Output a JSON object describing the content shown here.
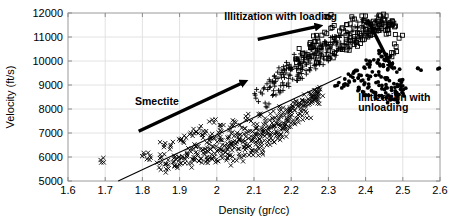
{
  "chart_data": {
    "type": "scatter",
    "title": "",
    "xlabel": "Density (gr/cc)",
    "ylabel": "Velocity (ft/s)",
    "xlim": [
      1.6,
      2.6
    ],
    "ylim": [
      5000,
      12000
    ],
    "xticks": [
      "1.6",
      "1.7",
      "1.8",
      "1.9",
      "2",
      "2.1",
      "2.2",
      "2.3",
      "2.4",
      "2.5",
      "2.6"
    ],
    "xtick_values": [
      1.6,
      1.7,
      1.8,
      1.9,
      2.0,
      2.1,
      2.2,
      2.3,
      2.4,
      2.5,
      2.6
    ],
    "yticks": [
      "5000",
      "6000",
      "7000",
      "8000",
      "9000",
      "10000",
      "11000",
      "12000"
    ],
    "ytick_values": [
      5000,
      6000,
      7000,
      8000,
      9000,
      10000,
      11000,
      12000
    ],
    "grid": true,
    "legend": "none",
    "marker_color": "#000000",
    "series": [
      {
        "name": "smectite-trend-points",
        "marker": "x",
        "points": [
          [
            1.695,
            5960
          ],
          [
            1.805,
            6080
          ],
          [
            1.812,
            5910
          ],
          [
            1.845,
            5560
          ],
          [
            1.852,
            5980
          ],
          [
            1.858,
            6410
          ],
          [
            1.864,
            5700
          ],
          [
            1.87,
            5520
          ],
          [
            1.876,
            6500
          ],
          [
            1.882,
            5780
          ],
          [
            1.888,
            6010
          ],
          [
            1.893,
            5620
          ],
          [
            1.899,
            5880
          ],
          [
            1.905,
            6760
          ],
          [
            1.91,
            6650
          ],
          [
            1.915,
            5900
          ],
          [
            1.92,
            6180
          ],
          [
            1.925,
            5730
          ],
          [
            1.93,
            6220
          ],
          [
            1.935,
            6880
          ],
          [
            1.938,
            7000
          ],
          [
            1.941,
            5870
          ],
          [
            1.944,
            6440
          ],
          [
            1.948,
            6060
          ],
          [
            1.952,
            5840
          ],
          [
            1.956,
            6330
          ],
          [
            1.96,
            6920
          ],
          [
            1.964,
            7080
          ],
          [
            1.967,
            6120
          ],
          [
            1.97,
            5790
          ],
          [
            1.973,
            6600
          ],
          [
            1.977,
            6230
          ],
          [
            1.981,
            5960
          ],
          [
            1.985,
            6780
          ],
          [
            1.988,
            7550
          ],
          [
            1.991,
            6420
          ],
          [
            1.995,
            6140
          ],
          [
            1.998,
            5880
          ],
          [
            2.001,
            6630
          ],
          [
            2.005,
            7020
          ],
          [
            2.008,
            6350
          ],
          [
            2.011,
            6060
          ],
          [
            2.015,
            6700
          ],
          [
            2.018,
            7330
          ],
          [
            2.021,
            6480
          ],
          [
            2.024,
            6200
          ],
          [
            2.028,
            5960
          ],
          [
            2.031,
            6760
          ],
          [
            2.034,
            7120
          ],
          [
            2.038,
            6560
          ],
          [
            2.041,
            6280
          ],
          [
            2.044,
            5840
          ],
          [
            2.047,
            6880
          ],
          [
            2.051,
            7440
          ],
          [
            2.054,
            6620
          ],
          [
            2.057,
            6340
          ],
          [
            2.06,
            6020
          ],
          [
            2.064,
            6940
          ],
          [
            2.067,
            7210
          ],
          [
            2.07,
            6700
          ],
          [
            2.073,
            6400
          ],
          [
            2.076,
            6100
          ],
          [
            2.08,
            7000
          ],
          [
            2.083,
            7600
          ],
          [
            2.086,
            6780
          ],
          [
            2.089,
            6460
          ],
          [
            2.092,
            6180
          ],
          [
            2.096,
            7060
          ],
          [
            2.099,
            7380
          ],
          [
            2.102,
            6840
          ],
          [
            2.105,
            6520
          ],
          [
            2.108,
            6240
          ],
          [
            2.112,
            7120
          ],
          [
            2.115,
            7700
          ],
          [
            2.118,
            6900
          ],
          [
            2.121,
            6580
          ],
          [
            2.124,
            6300
          ],
          [
            2.128,
            7180
          ],
          [
            2.131,
            7500
          ],
          [
            2.134,
            6960
          ],
          [
            2.137,
            6640
          ],
          [
            2.14,
            7240
          ],
          [
            2.144,
            7800
          ],
          [
            2.147,
            7020
          ],
          [
            2.15,
            6700
          ],
          [
            2.153,
            7300
          ],
          [
            2.156,
            7620
          ],
          [
            2.16,
            7080
          ],
          [
            2.163,
            6760
          ],
          [
            2.166,
            7360
          ],
          [
            2.169,
            7900
          ],
          [
            2.172,
            7140
          ],
          [
            2.176,
            6820
          ],
          [
            2.179,
            7420
          ],
          [
            2.182,
            7740
          ],
          [
            2.185,
            7200
          ],
          [
            2.188,
            7980
          ],
          [
            2.192,
            7480
          ],
          [
            2.195,
            7860
          ],
          [
            2.198,
            7260
          ],
          [
            2.202,
            8060
          ],
          [
            2.206,
            7540
          ],
          [
            2.21,
            7940
          ],
          [
            2.214,
            8180
          ],
          [
            2.218,
            7620
          ],
          [
            2.222,
            8260
          ],
          [
            2.226,
            8020
          ],
          [
            2.23,
            7720
          ],
          [
            2.234,
            8340
          ],
          [
            2.238,
            8120
          ],
          [
            2.242,
            7820
          ],
          [
            2.246,
            8420
          ],
          [
            2.25,
            8220
          ],
          [
            2.254,
            8520
          ],
          [
            2.258,
            8320
          ],
          [
            2.262,
            8620
          ],
          [
            2.266,
            8420
          ],
          [
            2.27,
            8720
          ],
          [
            2.274,
            8520
          ],
          [
            2.278,
            8820
          ]
        ]
      },
      {
        "name": "illitization-loading-plus",
        "marker": "plus",
        "points": [
          [
            2.105,
            8450
          ],
          [
            2.118,
            8700
          ],
          [
            2.13,
            8250
          ],
          [
            2.142,
            8900
          ],
          [
            2.15,
            8560
          ],
          [
            2.158,
            9150
          ],
          [
            2.166,
            8780
          ],
          [
            2.174,
            9320
          ],
          [
            2.18,
            8980
          ],
          [
            2.186,
            9500
          ],
          [
            2.192,
            9080
          ],
          [
            2.198,
            9620
          ],
          [
            2.204,
            9240
          ],
          [
            2.21,
            9780
          ],
          [
            2.216,
            9360
          ],
          [
            2.222,
            9900
          ],
          [
            2.228,
            9480
          ],
          [
            2.234,
            10050
          ],
          [
            2.24,
            9600
          ],
          [
            2.246,
            10180
          ],
          [
            2.252,
            9720
          ],
          [
            2.258,
            10300
          ],
          [
            2.264,
            9840
          ],
          [
            2.27,
            10420
          ],
          [
            2.276,
            9960
          ],
          [
            2.282,
            10540
          ],
          [
            2.288,
            10080
          ],
          [
            2.294,
            10660
          ],
          [
            2.3,
            10200
          ],
          [
            2.306,
            10780
          ],
          [
            2.312,
            10320
          ],
          [
            2.318,
            10880
          ],
          [
            2.324,
            10440
          ],
          [
            2.33,
            10980
          ],
          [
            2.336,
            10560
          ],
          [
            2.342,
            11080
          ],
          [
            2.348,
            10680
          ],
          [
            2.354,
            11180
          ],
          [
            2.36,
            10800
          ],
          [
            2.366,
            11280
          ],
          [
            2.372,
            10920
          ],
          [
            2.378,
            11380
          ],
          [
            2.384,
            11040
          ],
          [
            2.39,
            11480
          ],
          [
            2.396,
            11160
          ],
          [
            2.402,
            11580
          ],
          [
            2.408,
            11280
          ],
          [
            2.414,
            11620
          ],
          [
            2.42,
            11400
          ],
          [
            2.426,
            11680
          ],
          [
            2.135,
            9050
          ],
          [
            2.155,
            9380
          ],
          [
            2.175,
            9620
          ],
          [
            2.195,
            9860
          ],
          [
            2.215,
            10100
          ],
          [
            2.235,
            10340
          ],
          [
            2.255,
            10480
          ],
          [
            2.275,
            10620
          ],
          [
            2.295,
            10760
          ],
          [
            2.315,
            10900
          ]
        ]
      },
      {
        "name": "illitization-loading-squares",
        "marker": "square",
        "points": [
          [
            2.225,
            9750
          ],
          [
            2.24,
            10000
          ],
          [
            2.255,
            10200
          ],
          [
            2.268,
            9920
          ],
          [
            2.28,
            10400
          ],
          [
            2.292,
            10120
          ],
          [
            2.304,
            10600
          ],
          [
            2.316,
            10320
          ],
          [
            2.328,
            10750
          ],
          [
            2.338,
            10480
          ],
          [
            2.348,
            10900
          ],
          [
            2.358,
            10620
          ],
          [
            2.368,
            11020
          ],
          [
            2.376,
            10780
          ],
          [
            2.384,
            11150
          ],
          [
            2.392,
            10880
          ],
          [
            2.4,
            11300
          ],
          [
            2.406,
            11000
          ],
          [
            2.412,
            11420
          ],
          [
            2.418,
            11100
          ],
          [
            2.424,
            11550
          ],
          [
            2.43,
            11250
          ],
          [
            2.436,
            11650
          ],
          [
            2.442,
            11350
          ],
          [
            2.448,
            11750
          ],
          [
            2.452,
            11450
          ],
          [
            2.458,
            11300
          ],
          [
            2.462,
            11150
          ],
          [
            2.468,
            11500
          ],
          [
            2.472,
            11650
          ],
          [
            2.3,
            11820
          ],
          [
            2.37,
            11750
          ],
          [
            2.39,
            11880
          ],
          [
            2.44,
            11880
          ],
          [
            2.452,
            11700
          ],
          [
            2.466,
            11600
          ],
          [
            2.478,
            11420
          ],
          [
            2.49,
            10950
          ],
          [
            2.482,
            10600
          ],
          [
            2.47,
            10350
          ],
          [
            2.25,
            10700
          ],
          [
            2.27,
            10950
          ],
          [
            2.29,
            11200
          ],
          [
            2.31,
            11400
          ],
          [
            2.33,
            11250
          ],
          [
            2.35,
            11520
          ],
          [
            2.212,
            10080
          ],
          [
            2.232,
            10330
          ],
          [
            2.252,
            10560
          ],
          [
            2.272,
            10830
          ]
        ]
      },
      {
        "name": "illitization-unloading-dots",
        "marker": "dot",
        "points": [
          [
            2.375,
            9600
          ],
          [
            2.388,
            9400
          ],
          [
            2.398,
            9700
          ],
          [
            2.408,
            9250
          ],
          [
            2.418,
            9550
          ],
          [
            2.428,
            9100
          ],
          [
            2.436,
            9420
          ],
          [
            2.444,
            8980
          ],
          [
            2.452,
            9300
          ],
          [
            2.458,
            8880
          ],
          [
            2.464,
            9180
          ],
          [
            2.47,
            8780
          ],
          [
            2.476,
            9060
          ],
          [
            2.48,
            8680
          ],
          [
            2.486,
            8940
          ],
          [
            2.49,
            8600
          ],
          [
            2.494,
            8820
          ],
          [
            2.498,
            8700
          ],
          [
            2.396,
            9020
          ],
          [
            2.406,
            8880
          ],
          [
            2.416,
            8760
          ],
          [
            2.426,
            8640
          ],
          [
            2.436,
            8560
          ],
          [
            2.446,
            8500
          ],
          [
            2.456,
            8460
          ],
          [
            2.466,
            8420
          ],
          [
            2.476,
            8400
          ],
          [
            2.486,
            8380
          ],
          [
            2.382,
            8900
          ],
          [
            2.392,
            8720
          ],
          [
            2.402,
            8580
          ],
          [
            2.412,
            9850
          ],
          [
            2.422,
            10050
          ],
          [
            2.432,
            9920
          ],
          [
            2.442,
            10180
          ],
          [
            2.448,
            9780
          ],
          [
            2.454,
            10020
          ],
          [
            2.46,
            9680
          ],
          [
            2.37,
            9180
          ],
          [
            2.36,
            9380
          ],
          [
            2.352,
            9000
          ],
          [
            2.344,
            9250
          ],
          [
            2.336,
            8880
          ],
          [
            2.328,
            9100
          ],
          [
            2.44,
            10400
          ],
          [
            2.456,
            10280
          ],
          [
            2.472,
            9900
          ],
          [
            2.484,
            9540
          ],
          [
            2.494,
            9200
          ],
          [
            2.5,
            8960
          ],
          [
            2.598,
            9700
          ],
          [
            2.54,
            9700
          ]
        ]
      }
    ],
    "trendline": {
      "name": "smectite-normal-compaction-line",
      "x_from": 1.735,
      "y_from": 5000,
      "x_to": 2.335,
      "y_to": 9350
    },
    "annotations": [
      {
        "name": "smectite-label",
        "text": "Smectite",
        "x": 1.78,
        "y": 8150
      },
      {
        "name": "illitization-loading-label",
        "text": "Illitization with loading",
        "x": 2.02,
        "y": 11720
      },
      {
        "name": "illitization-unloading-label-line1",
        "text": "Illitization with",
        "x": 2.38,
        "y": 8350
      },
      {
        "name": "illitization-unloading-label-line2",
        "text": "unloading",
        "x": 2.38,
        "y": 7900
      }
    ],
    "arrows": [
      {
        "name": "smectite-arrow",
        "x_from": 1.79,
        "y_from": 7070,
        "x_to": 2.065,
        "y_to": 9060
      },
      {
        "name": "illitization-loading-arrow",
        "x_from": 2.11,
        "y_from": 10900,
        "x_to": 2.265,
        "y_to": 11420
      },
      {
        "name": "illitization-unloading-arrow",
        "x_from": 2.405,
        "y_from": 11730,
        "x_to": 2.465,
        "y_to": 9900
      }
    ]
  }
}
